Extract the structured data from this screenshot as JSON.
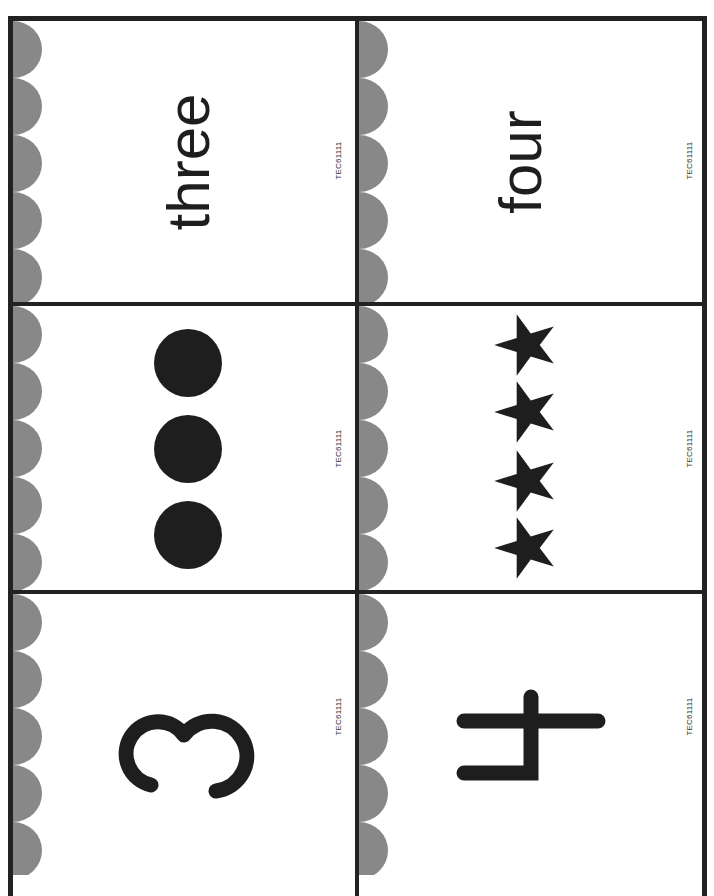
{
  "document": {
    "type": "number-matching-cards",
    "layout": {
      "columns": 2,
      "rows": 3,
      "orientation": "rotated-90-ccw"
    },
    "colors": {
      "border": "#222222",
      "scallop": "#888888",
      "ink": "#1e1e1e",
      "background": "#ffffff"
    }
  },
  "cards": [
    {
      "id": "three-word",
      "kind": "word",
      "text": "three",
      "code": "TEC61111"
    },
    {
      "id": "four-word",
      "kind": "word",
      "text": "four",
      "code": "TEC61111"
    },
    {
      "id": "three-dots",
      "kind": "dots",
      "count": 3,
      "shape": "circle-icon",
      "code": "TEC61111"
    },
    {
      "id": "four-stars",
      "kind": "stars",
      "count": 4,
      "shape": "star-icon",
      "code": "TEC61111"
    },
    {
      "id": "three-numeral",
      "kind": "numeral",
      "text": "3",
      "code": "TEC61111"
    },
    {
      "id": "four-numeral",
      "kind": "numeral",
      "text": "4",
      "code": "TEC61111"
    }
  ]
}
